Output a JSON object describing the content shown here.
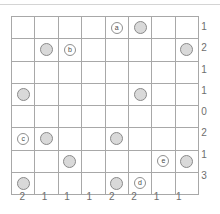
{
  "puzzle": {
    "type": "grid-logic-puzzle",
    "rows": 8,
    "cols": 8,
    "colors": {
      "grid_line": "#a8a8a8",
      "stone_fill": "#d9d9d9",
      "stone_border": "#8a8a8a",
      "marker_fill": "#ffffff",
      "marker_border": "#8f8f8f",
      "clue_text": "#6e6e6e",
      "top_rule": "#d4d4d4"
    },
    "row_clues": [
      "1",
      "2",
      "1",
      "1",
      "0",
      "2",
      "1",
      "3"
    ],
    "col_clues": [
      "2",
      "1",
      "1",
      "1",
      "2",
      "2",
      "1",
      "1"
    ],
    "cells": [
      [
        {
          "kind": "empty",
          "label": ""
        },
        {
          "kind": "empty",
          "label": ""
        },
        {
          "kind": "empty",
          "label": ""
        },
        {
          "kind": "empty",
          "label": ""
        },
        {
          "kind": "marker",
          "label": "a"
        },
        {
          "kind": "stone",
          "label": ""
        },
        {
          "kind": "empty",
          "label": ""
        },
        {
          "kind": "empty",
          "label": ""
        }
      ],
      [
        {
          "kind": "empty",
          "label": ""
        },
        {
          "kind": "stone",
          "label": ""
        },
        {
          "kind": "marker",
          "label": "b"
        },
        {
          "kind": "empty",
          "label": ""
        },
        {
          "kind": "empty",
          "label": ""
        },
        {
          "kind": "empty",
          "label": ""
        },
        {
          "kind": "empty",
          "label": ""
        },
        {
          "kind": "stone",
          "label": ""
        }
      ],
      [
        {
          "kind": "empty",
          "label": ""
        },
        {
          "kind": "empty",
          "label": ""
        },
        {
          "kind": "empty",
          "label": ""
        },
        {
          "kind": "empty",
          "label": ""
        },
        {
          "kind": "empty",
          "label": ""
        },
        {
          "kind": "empty",
          "label": ""
        },
        {
          "kind": "empty",
          "label": ""
        },
        {
          "kind": "empty",
          "label": ""
        }
      ],
      [
        {
          "kind": "stone",
          "label": ""
        },
        {
          "kind": "empty",
          "label": ""
        },
        {
          "kind": "empty",
          "label": ""
        },
        {
          "kind": "empty",
          "label": ""
        },
        {
          "kind": "empty",
          "label": ""
        },
        {
          "kind": "stone",
          "label": ""
        },
        {
          "kind": "empty",
          "label": ""
        },
        {
          "kind": "empty",
          "label": ""
        }
      ],
      [
        {
          "kind": "empty",
          "label": ""
        },
        {
          "kind": "empty",
          "label": ""
        },
        {
          "kind": "empty",
          "label": ""
        },
        {
          "kind": "empty",
          "label": ""
        },
        {
          "kind": "empty",
          "label": ""
        },
        {
          "kind": "empty",
          "label": ""
        },
        {
          "kind": "empty",
          "label": ""
        },
        {
          "kind": "empty",
          "label": ""
        }
      ],
      [
        {
          "kind": "marker",
          "label": "c"
        },
        {
          "kind": "stone",
          "label": ""
        },
        {
          "kind": "empty",
          "label": ""
        },
        {
          "kind": "empty",
          "label": ""
        },
        {
          "kind": "stone",
          "label": ""
        },
        {
          "kind": "empty",
          "label": ""
        },
        {
          "kind": "empty",
          "label": ""
        },
        {
          "kind": "empty",
          "label": ""
        }
      ],
      [
        {
          "kind": "empty",
          "label": ""
        },
        {
          "kind": "empty",
          "label": ""
        },
        {
          "kind": "stone",
          "label": ""
        },
        {
          "kind": "empty",
          "label": ""
        },
        {
          "kind": "empty",
          "label": ""
        },
        {
          "kind": "empty",
          "label": ""
        },
        {
          "kind": "marker",
          "label": "e"
        },
        {
          "kind": "stone",
          "label": ""
        }
      ],
      [
        {
          "kind": "stone",
          "label": ""
        },
        {
          "kind": "empty",
          "label": ""
        },
        {
          "kind": "empty",
          "label": ""
        },
        {
          "kind": "empty",
          "label": ""
        },
        {
          "kind": "stone",
          "label": ""
        },
        {
          "kind": "marker",
          "label": "d"
        },
        {
          "kind": "empty",
          "label": ""
        },
        {
          "kind": "empty",
          "label": ""
        }
      ]
    ]
  }
}
